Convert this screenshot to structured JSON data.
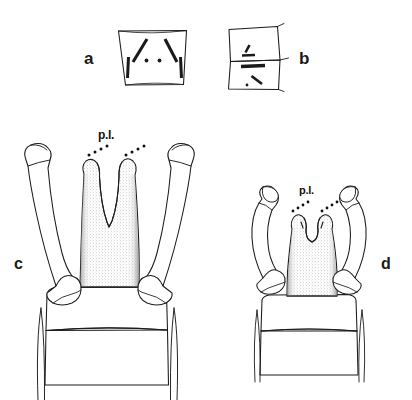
{
  "figure": {
    "type": "scientific-line-drawing",
    "background_color": "#ffffff",
    "ink_color": "#1a1a1a",
    "shading_color": "#8a8a8a",
    "panels": [
      {
        "id": "a",
        "label": "a",
        "description": "trapezoidal plate in dorsal view with paired diagonal setae near upper corners, paired vertical setae at lower lateral margins, and two central punctures"
      },
      {
        "id": "b",
        "label": "b",
        "description": "two stacked quadrangular plates in lateral view bearing short oblique and transverse setal marks"
      },
      {
        "id": "c",
        "label": "c",
        "description": "terminalia with elongate curved lateral claspers and a deeply V-notched median plate; posterior lobe annotated",
        "annotation": "p.l."
      },
      {
        "id": "d",
        "label": "d",
        "description": "terminalia with shorter sinuate lateral claspers and a broad shallowly notched median plate; posterior lobe annotated",
        "annotation": "p.l."
      }
    ],
    "annotation_key": {
      "abbreviation": "p.l.",
      "leader_style": "dotted"
    }
  }
}
